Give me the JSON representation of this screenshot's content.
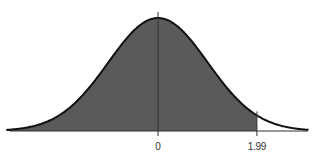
{
  "chart_data": {
    "type": "area",
    "title": "",
    "distribution": "standard normal",
    "mean": 0,
    "std_dev": 1,
    "shaded_region": {
      "from": "-inf",
      "to": 1.99
    },
    "x_range": [
      -3,
      3
    ],
    "tick_labels": [
      "0",
      "1.99"
    ],
    "tick_values": [
      0,
      1.99
    ],
    "xlabel": "",
    "ylabel": "",
    "grid": false,
    "colors": {
      "fill": "#5a5a5a",
      "curve": "#111111",
      "axis": "#333333"
    }
  },
  "labels": {
    "mean": "0",
    "z": "1.99"
  }
}
